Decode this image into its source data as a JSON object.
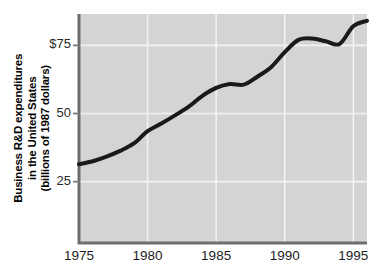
{
  "chart_data": {
    "type": "line",
    "title": "",
    "xlabel": "",
    "ylabel": "Business R&D expenditures in the United States (billions of 1987 dollars)",
    "ylabel_lines": [
      "Business R&D expenditures",
      "in the United States",
      "(billions of 1987 dollars)"
    ],
    "x": [
      1975,
      1976,
      1977,
      1978,
      1979,
      1980,
      1981,
      1982,
      1983,
      1984,
      1985,
      1986,
      1987,
      1988,
      1989,
      1990,
      1991,
      1992,
      1993,
      1994,
      1995,
      1996
    ],
    "values": [
      31.4,
      32.5,
      34.2,
      36.3,
      39.0,
      43.5,
      46.3,
      49.3,
      52.5,
      56.5,
      59.4,
      60.8,
      60.6,
      63.5,
      67.0,
      72.5,
      77.0,
      77.5,
      76.5,
      75.5,
      82.0,
      84.0
    ],
    "xtick_labels": [
      "1975",
      "1980",
      "1985",
      "1990",
      "1995"
    ],
    "xticks": [
      1975,
      1980,
      1985,
      1990,
      1995
    ],
    "ytick_labels": [
      "$75",
      "50",
      "25"
    ],
    "yticks": [
      75,
      50,
      25
    ],
    "xlim": [
      1975,
      1996
    ],
    "ylim": [
      2.5,
      86.5
    ],
    "grid": true,
    "legend": null,
    "series_color": "#1a1a1a",
    "plot_background": "#d4d4d4",
    "gridline_color": "#f2f2f2",
    "axis_color": "#6e6e6e"
  }
}
